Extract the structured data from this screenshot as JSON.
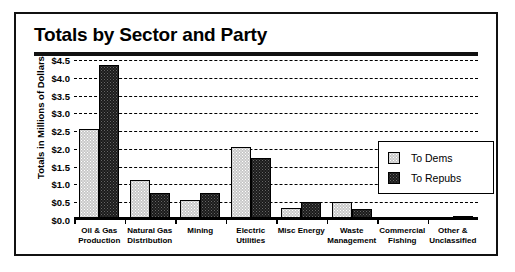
{
  "chart_data": {
    "type": "bar",
    "title": "Totals by Sector and Party",
    "xlabel": "",
    "ylabel": "Totals in Millions of Dollars",
    "ylim": [
      0,
      4.5
    ],
    "ytick_labels": [
      "$4.5",
      "$4.0",
      "$3.5",
      "$3.0",
      "$2.5",
      "$2.0",
      "$1.5",
      "$1.0",
      "$0.5",
      "$0.0"
    ],
    "ytick_values": [
      4.5,
      4.0,
      3.5,
      3.0,
      2.5,
      2.0,
      1.5,
      1.0,
      0.5,
      0.0
    ],
    "grid": true,
    "legend_position": "upper right",
    "categories": [
      "Oil & Gas Production",
      "Natural Gas Distribution",
      "Mining",
      "Electric Utilities",
      "Misc Energy",
      "Waste Management",
      "Commercial Fishing",
      "Other & Unclassified"
    ],
    "category_lines": [
      [
        "Oil & Gas",
        "Production"
      ],
      [
        "Natural Gas",
        "Distribution"
      ],
      [
        "Mining",
        ""
      ],
      [
        "Electric",
        "Utilities"
      ],
      [
        "Misc Energy",
        ""
      ],
      [
        "Waste",
        "Management"
      ],
      [
        "Commercial",
        "Fishing"
      ],
      [
        "Other &",
        "Unclassified"
      ]
    ],
    "series": [
      {
        "name": "To Dems",
        "color": "#c9c9c9",
        "values": [
          2.55,
          1.12,
          0.55,
          2.05,
          0.35,
          0.5,
          0.02,
          0.02
        ]
      },
      {
        "name": "To Repubs",
        "color": "#1b1b1b",
        "values": [
          4.35,
          0.76,
          0.76,
          1.75,
          0.5,
          0.3,
          0.03,
          0.12
        ]
      }
    ]
  },
  "legend": {
    "entries": [
      {
        "label": "To Dems"
      },
      {
        "label": "To Repubs"
      }
    ]
  }
}
